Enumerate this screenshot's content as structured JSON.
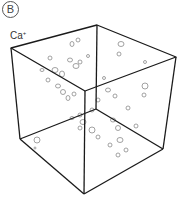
{
  "figure": {
    "panel_label": "B",
    "ion_label": "Ca",
    "ion_charge": "+",
    "colors": {
      "edges": "#1a1a1a",
      "blobs": "#888888",
      "background": "#ffffff"
    }
  }
}
